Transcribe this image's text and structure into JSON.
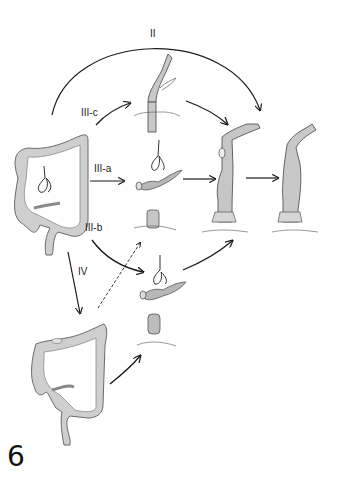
{
  "figure": {
    "number": "6",
    "labels": {
      "route_ii": "II",
      "route_iii_a": "III-a",
      "route_iii_b": "III-b",
      "route_iii_c": "III-c",
      "route_iv": "IV"
    },
    "colors": {
      "background": "#ffffff",
      "ink": "#1a1a1a",
      "tissue_fill": "#c9c9c9",
      "tissue_shadow": "#8f8f8f"
    }
  }
}
